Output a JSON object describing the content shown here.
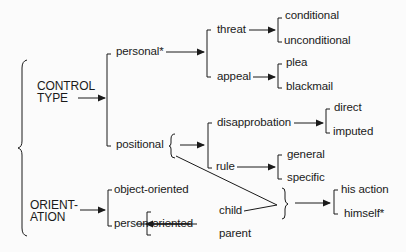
{
  "diagram": {
    "roots": [
      {
        "id": "control_type",
        "label_line1": "CONTROL",
        "label_line2": "TYPE"
      },
      {
        "id": "orientation",
        "label_line1": "ORIENT-",
        "label_line2": "ATION"
      }
    ],
    "nodes": {
      "personal": "personal*",
      "threat": "threat",
      "conditional": "conditional",
      "unconditional": "unconditional",
      "appeal": "appeal",
      "plea": "plea",
      "blackmail": "blackmail",
      "positional": "positional",
      "disapprobation": "disapprobation",
      "direct": "direct",
      "imputed": "imputed",
      "rule": "rule",
      "general": "general",
      "specific": "specific",
      "object_oriented": "object-oriented",
      "person_oriented": "person-oriented",
      "child": "child",
      "parent": "parent",
      "his_action": "his action",
      "himself": "himself*"
    },
    "edges": [
      [
        "CONTROL TYPE",
        "personal*"
      ],
      [
        "CONTROL TYPE",
        "positional"
      ],
      [
        "personal*",
        "threat"
      ],
      [
        "personal*",
        "appeal"
      ],
      [
        "threat",
        "conditional"
      ],
      [
        "threat",
        "unconditional"
      ],
      [
        "appeal",
        "plea"
      ],
      [
        "appeal",
        "blackmail"
      ],
      [
        "positional",
        "disapprobation"
      ],
      [
        "positional",
        "rule"
      ],
      [
        "disapprobation",
        "direct"
      ],
      [
        "disapprobation",
        "imputed"
      ],
      [
        "rule",
        "general"
      ],
      [
        "rule",
        "specific"
      ],
      [
        "ORIENTATION",
        "object-oriented"
      ],
      [
        "ORIENTATION",
        "person-oriented"
      ],
      [
        "person-oriented",
        "child"
      ],
      [
        "person-oriented",
        "parent"
      ],
      [
        "positional + child",
        "his action"
      ],
      [
        "positional + child",
        "himself*"
      ]
    ]
  }
}
